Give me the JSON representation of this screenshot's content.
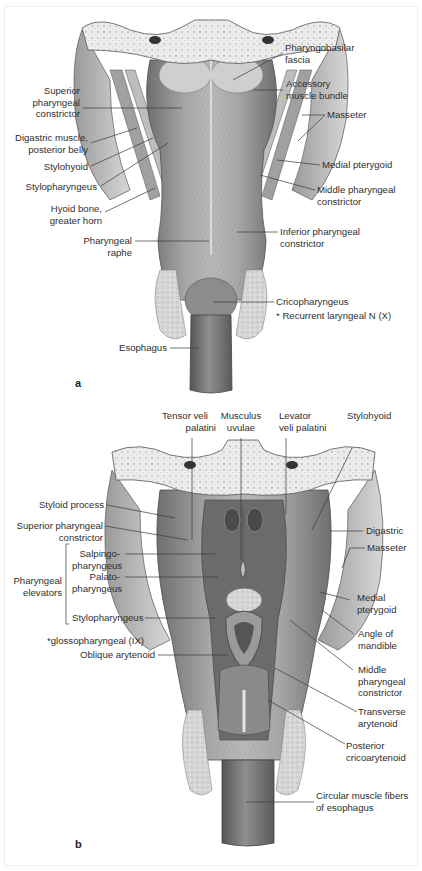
{
  "figure": {
    "panels": [
      {
        "letter": "a",
        "labels_left": [
          {
            "id": "superior-pharyngeal-constrictor",
            "lines": [
              "Superior",
              "pharyngeal",
              "constrictor"
            ]
          },
          {
            "id": "digastric-posterior-belly",
            "lines": [
              "Digastric muscle,",
              "posterior belly"
            ]
          },
          {
            "id": "stylohyoid",
            "lines": [
              "Stylohyoid"
            ]
          },
          {
            "id": "stylopharyngeus",
            "lines": [
              "Stylopharyngeus"
            ]
          },
          {
            "id": "hyoid-bone-greater-horn",
            "lines": [
              "Hyoid bone,",
              "greater horn"
            ]
          },
          {
            "id": "pharyngeal-raphe",
            "lines": [
              "Pharyngeal",
              "raphe"
            ]
          },
          {
            "id": "esophagus",
            "lines": [
              "Esophagus"
            ]
          }
        ],
        "labels_right": [
          {
            "id": "pharyngobasilar-fascia",
            "lines": [
              "Pharyngobasilar",
              "fascia"
            ]
          },
          {
            "id": "accessory-muscle-bundle",
            "lines": [
              "Accessory",
              "muscle bundle"
            ]
          },
          {
            "id": "masseter",
            "lines": [
              "Masseter"
            ]
          },
          {
            "id": "medial-pterygoid",
            "lines": [
              "Medial pterygoid"
            ]
          },
          {
            "id": "middle-pharyngeal-constrictor",
            "lines": [
              "Middle pharyngeal",
              "constrictor"
            ]
          },
          {
            "id": "inferior-pharyngeal-constrictor",
            "lines": [
              "Inferior pharyngeal",
              "constrictor"
            ]
          },
          {
            "id": "cricopharyngeus",
            "lines": [
              "Cricopharyngeus"
            ]
          },
          {
            "id": "recurrent-laryngeal-note",
            "lines": [
              "* Recurrent laryngeal N (X)"
            ]
          }
        ]
      },
      {
        "letter": "b",
        "labels_top": [
          {
            "id": "tensor-veli-palatini",
            "lines": [
              "Tensor veli",
              "palatini"
            ]
          },
          {
            "id": "musculus-uvulae",
            "lines": [
              "Musculus",
              "uvulae"
            ]
          },
          {
            "id": "levator-veli-palatini",
            "lines": [
              "Levator",
              "veli palatini"
            ]
          },
          {
            "id": "stylohyoid",
            "lines": [
              "Stylohyoid"
            ]
          }
        ],
        "labels_left": [
          {
            "id": "styloid-process",
            "lines": [
              "Styloid process"
            ]
          },
          {
            "id": "superior-pharyngeal-constrictor",
            "lines": [
              "Superior pharyngeal",
              "constrictor"
            ]
          },
          {
            "id": "salpingopharyngeus",
            "lines": [
              "Salpingo-",
              "pharyngeus"
            ]
          },
          {
            "id": "palatopharyngeus",
            "lines": [
              "Palato-",
              "pharyngeus"
            ]
          },
          {
            "id": "stylopharyngeus",
            "lines": [
              "Stylopharyngeus"
            ]
          },
          {
            "id": "glossopharyngeal-note",
            "lines": [
              "*glossopharyngeal (IX)"
            ]
          },
          {
            "id": "oblique-arytenoid",
            "lines": [
              "Oblique arytenoid"
            ]
          }
        ],
        "group_label": {
          "id": "pharyngeal-elevators",
          "lines": [
            "Pharyngeal",
            "elevators"
          ]
        },
        "labels_right": [
          {
            "id": "digastric",
            "lines": [
              "Digastric"
            ]
          },
          {
            "id": "masseter",
            "lines": [
              "Masseter"
            ]
          },
          {
            "id": "medial-pterygoid",
            "lines": [
              "Medial",
              "pterygoid"
            ]
          },
          {
            "id": "angle-of-mandible",
            "lines": [
              "Angle of",
              "mandible"
            ]
          },
          {
            "id": "middle-pharyngeal-constrictor",
            "lines": [
              "Middle",
              "pharyngeal",
              "constrictor"
            ]
          },
          {
            "id": "transverse-arytenoid",
            "lines": [
              "Transverse",
              "arytenoid"
            ]
          },
          {
            "id": "posterior-cricoarytenoid",
            "lines": [
              "Posterior",
              "cricoarytenoid"
            ]
          },
          {
            "id": "circular-muscle-fibers",
            "lines": [
              "Circular muscle fibers",
              "of esophagus"
            ]
          }
        ]
      }
    ]
  },
  "colors": {
    "muscle_dark": "#7d7d7d",
    "muscle_mid": "#a9a9a9",
    "muscle_light": "#cfcfcf",
    "bone": "#e8e8e8",
    "leader_line": "#3a3a3a",
    "text": "#2f2f2f"
  }
}
